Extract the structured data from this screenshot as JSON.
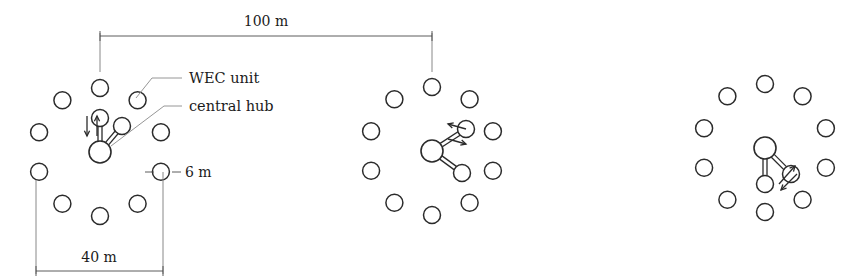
{
  "figure": {
    "background": "#ffffff",
    "stroke_color": "#2b2b2b",
    "dim_color": "#4a4a4a",
    "leader_color": "#8a8a8a"
  },
  "labels": {
    "wec_unit": "WEC unit",
    "central_hub": "central hub"
  },
  "dimensions": {
    "spacing": "100 m",
    "cluster_width": "40 m",
    "unit_diameter": "6 m"
  },
  "chart_data": {
    "type": "diagram",
    "annotations": [
      "100 m",
      "40 m",
      "6 m",
      "WEC unit",
      "central hub"
    ],
    "clusters": [
      {
        "id": "cluster-1",
        "center_x": 100,
        "center_y": 152,
        "hub_radius": 11,
        "wec_radius": 8.5,
        "ring_radius": 64,
        "ring_count": 10,
        "ring_start_angle": -90,
        "tether_targets": [
          0,
          1
        ],
        "arrow_group": "vertical-pair"
      },
      {
        "id": "cluster-2",
        "center_x": 432,
        "center_y": 151,
        "hub_radius": 11,
        "wec_radius": 8.5,
        "ring_radius": 64,
        "ring_count": 10,
        "ring_start_angle": -90,
        "tether_targets": [
          2,
          3
        ],
        "arrow_group": "diagonal-pair"
      },
      {
        "id": "cluster-3",
        "center_x": 765,
        "center_y": 148,
        "hub_radius": 11,
        "wec_radius": 8.5,
        "ring_radius": 64,
        "ring_count": 10,
        "ring_start_angle": -90,
        "tether_targets": [
          4,
          5
        ],
        "arrow_group": "lower-diagonal-pair"
      }
    ]
  }
}
